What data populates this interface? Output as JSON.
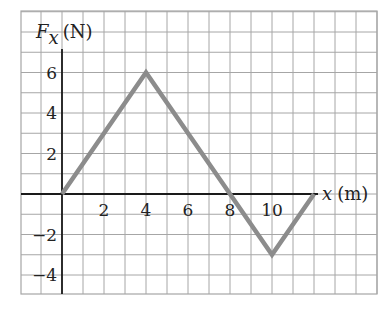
{
  "chart_data": {
    "type": "line",
    "title": "",
    "xlabel": "x (m)",
    "ylabel": "F_x (N)",
    "ylabel_parts": {
      "symbol": "F",
      "subscript": "x",
      "unit": "(N)"
    },
    "xlabel_parts": {
      "symbol": "x",
      "unit": "(m)"
    },
    "x": [
      0,
      4,
      8,
      10,
      12
    ],
    "series": [
      {
        "name": "F_x",
        "values": [
          0,
          6,
          0,
          -3,
          0
        ],
        "color": "#8c8c8c"
      }
    ],
    "xlim": [
      -2,
      15
    ],
    "ylim": [
      -5,
      9
    ],
    "x_ticks": [
      2,
      4,
      6,
      8,
      10
    ],
    "x_tick_labels": [
      "2",
      "4",
      "6",
      "8",
      "10"
    ],
    "y_ticks": [
      6,
      4,
      2,
      -2,
      -4
    ],
    "y_tick_labels": [
      "6",
      "4",
      "2",
      "−2",
      "−4"
    ],
    "grid": true,
    "grid_step": 1,
    "legend": null
  },
  "colors": {
    "grid": "#a6a6a6",
    "axis": "#1a1a1a",
    "line": "#8c8c8c"
  }
}
